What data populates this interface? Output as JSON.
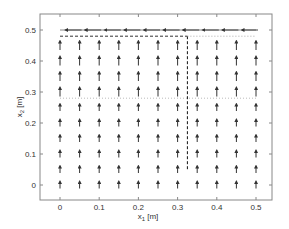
{
  "chart_data": {
    "type": "quiver",
    "title": "",
    "xlabel": "x_1 [m]",
    "ylabel": "x_2 [m]",
    "xlim": [
      -0.05,
      0.55
    ],
    "ylim": [
      -0.05,
      0.55
    ],
    "xticks": [
      0,
      0.1,
      0.2,
      0.3,
      0.4,
      0.5
    ],
    "xtick_labels": [
      "0",
      "0.1",
      "0.2",
      "0.3",
      "0.4",
      "0.5"
    ],
    "yticks": [
      0,
      0.1,
      0.2,
      0.3,
      0.4,
      0.5
    ],
    "ytick_labels": [
      "0",
      "0.1",
      "0.2",
      "0.3",
      "0.4",
      "0.5"
    ],
    "grid": false,
    "legend": null,
    "vector_field": {
      "x": [
        0,
        0.05,
        0.1,
        0.15,
        0.2,
        0.25,
        0.3,
        0.35,
        0.4,
        0.45,
        0.5
      ],
      "y_up_rows": [
        0,
        0.05,
        0.1,
        0.15,
        0.2,
        0.25,
        0.3,
        0.35,
        0.4,
        0.45
      ],
      "up_direction": [
        0,
        1
      ],
      "up_length_small": 0.02,
      "up_length_large": 0.03,
      "top_row_y": 0.5,
      "top_row_direction": [
        -1,
        0
      ],
      "top_row_length": 0.04
    },
    "lines": [
      {
        "name": "dashed-horizontal",
        "style": "dashed",
        "color": "#333333",
        "x": [
          0,
          0.325
        ],
        "y": [
          0.48,
          0.48
        ]
      },
      {
        "name": "dashed-vertical",
        "style": "dashed",
        "color": "#111111",
        "x": [
          0.325,
          0.325
        ],
        "y": [
          0.48,
          0.05
        ]
      },
      {
        "name": "dotted-horizontal-right",
        "style": "dotted",
        "color": "#aaaaaa",
        "x": [
          0.325,
          0.5
        ],
        "y": [
          0.48,
          0.48
        ]
      },
      {
        "name": "dotted-horizontal-mid",
        "style": "dotted",
        "color": "#bbbbbb",
        "x": [
          0,
          0.5
        ],
        "y": [
          0.28,
          0.28
        ]
      },
      {
        "name": "solid-top",
        "style": "solid",
        "color": "#888888",
        "x": [
          0,
          0.5
        ],
        "y": [
          0.5,
          0.5
        ]
      }
    ]
  }
}
